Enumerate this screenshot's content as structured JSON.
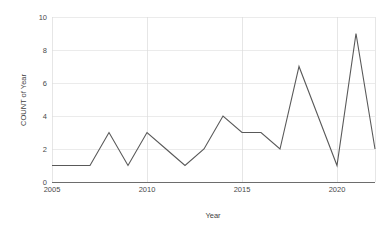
{
  "chart_data": {
    "type": "line",
    "title": "",
    "xlabel": "Year",
    "ylabel": "COUNT of Year",
    "x": [
      2005,
      2006,
      2007,
      2008,
      2009,
      2010,
      2011,
      2012,
      2013,
      2014,
      2015,
      2016,
      2017,
      2018,
      2019,
      2020,
      2021,
      2022
    ],
    "values": [
      1,
      1,
      1,
      3,
      1,
      3,
      2,
      1,
      2,
      4,
      3,
      3,
      2,
      7,
      4,
      1,
      9,
      2
    ],
    "series": [
      {
        "name": "COUNT of Year",
        "values": [
          1,
          1,
          1,
          3,
          1,
          3,
          2,
          1,
          2,
          4,
          3,
          3,
          2,
          7,
          4,
          1,
          9,
          2
        ]
      }
    ],
    "xlim": [
      2005,
      2022
    ],
    "ylim": [
      0,
      10
    ],
    "y_ticks": [
      0,
      2,
      4,
      6,
      8,
      10
    ],
    "y_tick_labels": [
      "0",
      "2",
      "4",
      "6",
      "8",
      "10"
    ],
    "x_ticks": [
      2005,
      2010,
      2015,
      2020
    ],
    "x_tick_labels": [
      "2005",
      "2010",
      "2015",
      "2020"
    ],
    "grid": {
      "horizontal": true,
      "vertical": true
    },
    "legend": {
      "visible": false,
      "position": "none"
    },
    "colors": {
      "line": "#595959",
      "gridline": "#e2e2e2",
      "vertical_gridline": "#dcdcdc",
      "axis": "#6d6d6d",
      "text": "#3f3f3f",
      "background": "#ffffff"
    }
  },
  "axes": {
    "x_title": "Year",
    "y_title": "COUNT of Year"
  }
}
